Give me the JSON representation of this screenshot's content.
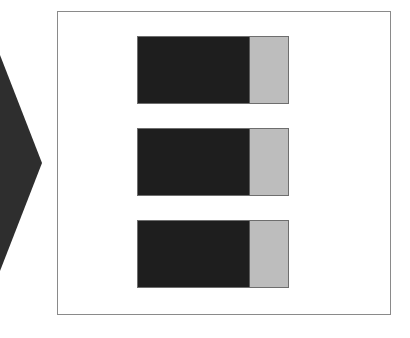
{
  "diagram": {
    "arrow": {
      "icon": "chevron-right-arrow",
      "color": "#2e2e2e"
    },
    "frame": {
      "border_color": "#8a8a8a",
      "background": "#ffffff"
    },
    "rows": [
      {
        "dark_color": "#1e1e1e",
        "light_color": "#bdbdbd",
        "top": 36
      },
      {
        "dark_color": "#1e1e1e",
        "light_color": "#bdbdbd",
        "top": 128
      },
      {
        "dark_color": "#1e1e1e",
        "light_color": "#bdbdbd",
        "top": 220
      }
    ]
  }
}
